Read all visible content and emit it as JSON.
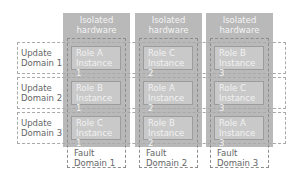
{
  "diagram": {
    "columns": [
      {
        "hardware_label": "Isolated\nhardware",
        "fault_domain_label": "Fault\nDomain 1"
      },
      {
        "hardware_label": "Isolated\nhardware",
        "fault_domain_label": "Fault\nDomain 2"
      },
      {
        "hardware_label": "Isolated\nhardware",
        "fault_domain_label": "Fault\nDomain 3"
      }
    ],
    "update_domains": [
      {
        "label": "Update\nDomain 1",
        "roles": [
          "Role A\nInstance 1",
          "Role C\nInstance 2",
          "Role B\nInstance 3"
        ]
      },
      {
        "label": "Update\nDomain 2",
        "roles": [
          "Role B\nInstance 1",
          "Role A\nInstance 2",
          "Role C\nInstance 3"
        ]
      },
      {
        "label": "Update\nDomain 3",
        "roles": [
          "Role C\nInstance 1",
          "Role B\nInstance 2",
          "Role A\nInstance 3"
        ]
      }
    ],
    "colors": {
      "hardware_fill": "#b9b9b9",
      "role_fill": "#c9c9c9",
      "text": "#666666"
    }
  }
}
